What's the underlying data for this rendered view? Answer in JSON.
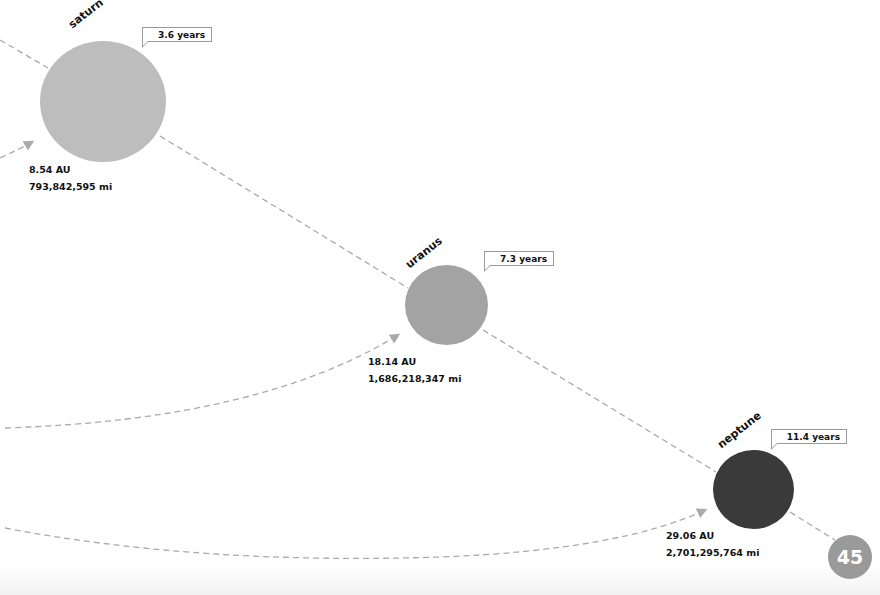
{
  "colors": {
    "saturn": "#bdbdbd",
    "uranus": "#a3a3a3",
    "neptune": "#3a3a3a",
    "dash": "#aaaaaa",
    "page_badge": "#9a9a9a"
  },
  "planets": [
    {
      "name": "saturn",
      "period": "3.6 years",
      "au": "8.54 AU",
      "miles": "793,842,595 mi"
    },
    {
      "name": "uranus",
      "period": "7.3 years",
      "au": "18.14 AU",
      "miles": "1,686,218,347 mi"
    },
    {
      "name": "neptune",
      "period": "11.4 years",
      "au": "29.06 AU",
      "miles": "2,701,295,764 mi"
    }
  ],
  "page_number": "45"
}
